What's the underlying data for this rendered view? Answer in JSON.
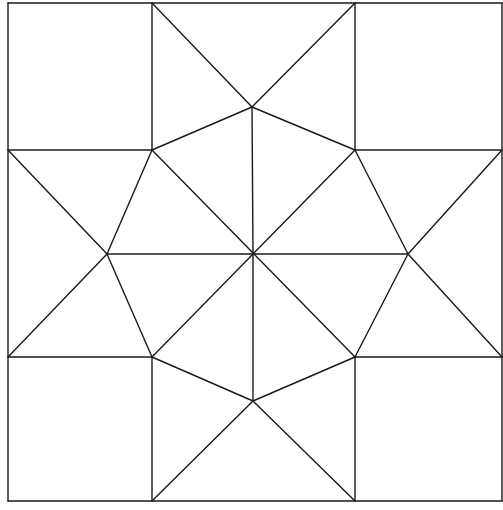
{
  "colors": {
    "background": "#ffffff",
    "line": "#1a1a1a"
  },
  "geometry": {
    "outer": {
      "x1": 8,
      "y1": 3,
      "x2": 502,
      "y2": 501
    },
    "center": [
      253,
      254
    ],
    "grid_x": [
      8,
      152,
      355,
      502
    ],
    "grid_y": [
      3,
      150,
      357,
      501
    ],
    "tips": {
      "top": [
        252,
        107
      ],
      "bottom": [
        253,
        401
      ],
      "left": [
        107,
        254
      ],
      "right": [
        408,
        254
      ]
    }
  }
}
